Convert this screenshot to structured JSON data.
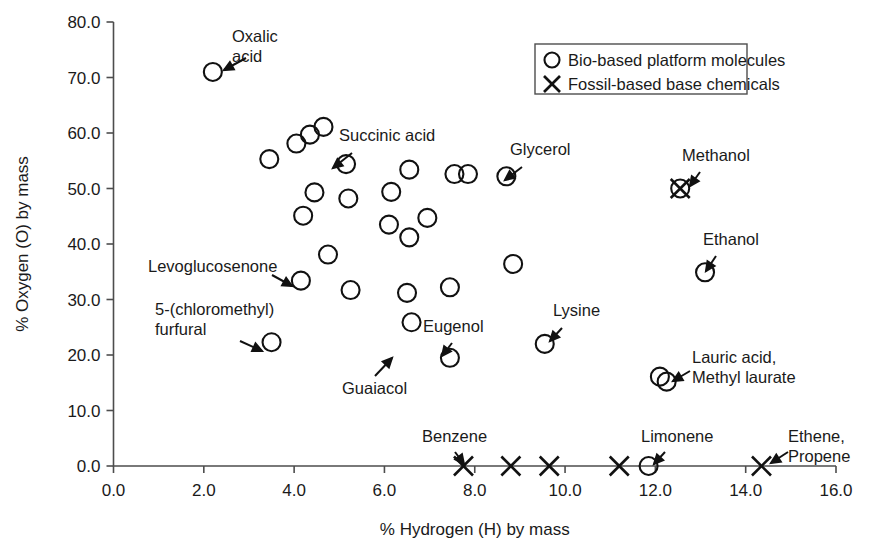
{
  "chart_data": {
    "type": "scatter",
    "title": "",
    "xlabel": "% Hydrogen (H) by mass",
    "ylabel": "% Oxygen (O) by mass",
    "xlim": [
      0.0,
      16.0
    ],
    "ylim": [
      0.0,
      80.0
    ],
    "xticks": [
      "0.0",
      "2.0",
      "4.0",
      "6.0",
      "8.0",
      "10.0",
      "12.0",
      "14.0",
      "16.0"
    ],
    "yticks": [
      "0.0",
      "10.0",
      "20.0",
      "30.0",
      "40.0",
      "50.0",
      "60.0",
      "70.0",
      "80.0"
    ],
    "grid": false,
    "legend_position": "top-right",
    "legend": [
      {
        "marker": "circle",
        "label": "Bio-based platform molecules"
      },
      {
        "marker": "x",
        "label": "Fossil-based base chemicals"
      }
    ],
    "series": [
      {
        "name": "Bio-based platform molecules",
        "marker": "circle",
        "points": [
          {
            "x": 2.2,
            "y": 71.0,
            "label": "Oxalic acid"
          },
          {
            "x": 3.45,
            "y": 55.3,
            "label": ""
          },
          {
            "x": 4.05,
            "y": 58.1,
            "label": ""
          },
          {
            "x": 4.35,
            "y": 59.7,
            "label": ""
          },
          {
            "x": 4.65,
            "y": 61.1,
            "label": ""
          },
          {
            "x": 5.15,
            "y": 54.4,
            "label": "Succinic acid"
          },
          {
            "x": 4.2,
            "y": 45.1,
            "label": ""
          },
          {
            "x": 4.45,
            "y": 49.3,
            "label": ""
          },
          {
            "x": 5.2,
            "y": 48.2,
            "label": ""
          },
          {
            "x": 6.15,
            "y": 49.4,
            "label": ""
          },
          {
            "x": 6.55,
            "y": 53.4,
            "label": ""
          },
          {
            "x": 6.1,
            "y": 43.5,
            "label": ""
          },
          {
            "x": 6.55,
            "y": 41.2,
            "label": ""
          },
          {
            "x": 6.95,
            "y": 44.7,
            "label": ""
          },
          {
            "x": 7.55,
            "y": 52.6,
            "label": ""
          },
          {
            "x": 7.85,
            "y": 52.6,
            "label": ""
          },
          {
            "x": 8.7,
            "y": 52.2,
            "label": "Glycerol"
          },
          {
            "x": 4.75,
            "y": 38.1,
            "label": ""
          },
          {
            "x": 4.15,
            "y": 33.4,
            "label": "Levoglucosenone"
          },
          {
            "x": 5.25,
            "y": 31.7,
            "label": ""
          },
          {
            "x": 6.5,
            "y": 31.2,
            "label": ""
          },
          {
            "x": 6.6,
            "y": 25.9,
            "label": "Guaiacol"
          },
          {
            "x": 3.5,
            "y": 22.3,
            "label": "5-(chloromethyl) furfural"
          },
          {
            "x": 7.45,
            "y": 32.2,
            "label": ""
          },
          {
            "x": 8.85,
            "y": 36.4,
            "label": ""
          },
          {
            "x": 7.45,
            "y": 19.5,
            "label": "Eugenol"
          },
          {
            "x": 9.55,
            "y": 22.0,
            "label": "Lysine"
          },
          {
            "x": 13.1,
            "y": 34.9,
            "label": "Ethanol"
          },
          {
            "x": 12.1,
            "y": 16.1,
            "label": "Lauric acid, Methyl laurate"
          },
          {
            "x": 12.25,
            "y": 15.2,
            "label": ""
          },
          {
            "x": 11.85,
            "y": 0.0,
            "label": "Limonene"
          }
        ]
      },
      {
        "name": "Fossil-based base chemicals",
        "marker": "x",
        "points": [
          {
            "x": 7.75,
            "y": 0.0,
            "label": "Benzene"
          },
          {
            "x": 8.8,
            "y": 0.0,
            "label": ""
          },
          {
            "x": 9.65,
            "y": 0.0,
            "label": ""
          },
          {
            "x": 11.2,
            "y": 0.0,
            "label": ""
          },
          {
            "x": 14.35,
            "y": 0.0,
            "label": "Ethene, Propene"
          },
          {
            "x": 12.55,
            "y": 50.0,
            "label": "Methanol"
          }
        ]
      }
    ],
    "annotations": [
      {
        "name": "oxalic-acid",
        "lines": [
          "Oxalic",
          "acid"
        ],
        "text_x": 232,
        "text_y": 42,
        "anchor": "start",
        "arrow_from": [
          246,
          58
        ],
        "arrow_to": [
          224,
          70
        ]
      },
      {
        "name": "succinic-acid",
        "lines": [
          "Succinic acid"
        ],
        "text_x": 339,
        "text_y": 141,
        "anchor": "start",
        "arrow_from": [
          352,
          153
        ],
        "arrow_to": [
          333,
          168
        ]
      },
      {
        "name": "glycerol",
        "lines": [
          "Glycerol"
        ],
        "text_x": 510,
        "text_y": 155,
        "anchor": "start",
        "arrow_from": [
          522,
          167
        ],
        "arrow_to": [
          505,
          180
        ]
      },
      {
        "name": "methanol",
        "lines": [
          "Methanol"
        ],
        "text_x": 682,
        "text_y": 161,
        "anchor": "start",
        "arrow_from": [
          700,
          172
        ],
        "arrow_to": [
          690,
          186
        ]
      },
      {
        "name": "ethanol",
        "lines": [
          "Ethanol"
        ],
        "text_x": 703,
        "text_y": 245,
        "anchor": "start",
        "arrow_from": [
          716,
          256
        ],
        "arrow_to": [
          706,
          271
        ]
      },
      {
        "name": "levoglucosenone",
        "lines": [
          "Levoglucosenone"
        ],
        "text_x": 148,
        "text_y": 272,
        "anchor": "start",
        "arrow_from": [
          272,
          275
        ],
        "arrow_to": [
          292,
          286
        ]
      },
      {
        "name": "chloromethyl-furfural",
        "lines": [
          "5-(chloromethyl)",
          "furfural"
        ],
        "text_x": 155,
        "text_y": 315,
        "anchor": "start",
        "arrow_from": [
          240,
          341
        ],
        "arrow_to": [
          262,
          351
        ]
      },
      {
        "name": "guaiacol",
        "lines": [
          "Guaiacol"
        ],
        "text_x": 342,
        "text_y": 394,
        "anchor": "start",
        "arrow_from": [
          375,
          376
        ],
        "arrow_to": [
          392,
          358
        ]
      },
      {
        "name": "eugenol",
        "lines": [
          "Eugenol"
        ],
        "text_x": 423,
        "text_y": 332,
        "anchor": "start",
        "arrow_from": [
          452,
          343
        ],
        "arrow_to": [
          442,
          356
        ]
      },
      {
        "name": "lysine",
        "lines": [
          "Lysine"
        ],
        "text_x": 553,
        "text_y": 316,
        "anchor": "start",
        "arrow_from": [
          562,
          328
        ],
        "arrow_to": [
          550,
          341
        ]
      },
      {
        "name": "lauric-acid",
        "lines": [
          "Lauric acid,",
          "Methyl laurate"
        ],
        "text_x": 692,
        "text_y": 363,
        "anchor": "start",
        "arrow_from": [
          690,
          371
        ],
        "arrow_to": [
          673,
          381
        ]
      },
      {
        "name": "benzene",
        "lines": [
          "Benzene"
        ],
        "text_x": 422,
        "text_y": 442,
        "anchor": "start",
        "arrow_from": [
          455,
          452
        ],
        "arrow_to": [
          464,
          464
        ]
      },
      {
        "name": "limonene",
        "lines": [
          "Limonene"
        ],
        "text_x": 641,
        "text_y": 442,
        "anchor": "start",
        "arrow_from": [
          665,
          452
        ],
        "arrow_to": [
          654,
          464
        ]
      },
      {
        "name": "ethene-propene",
        "lines": [
          "Ethene,",
          "Propene"
        ],
        "text_x": 788,
        "text_y": 442,
        "anchor": "start",
        "arrow_from": [
          788,
          452
        ],
        "arrow_to": [
          771,
          463
        ]
      }
    ]
  },
  "legend_panel": {
    "x": 535,
    "y": 44,
    "width": 212,
    "height": 50
  }
}
